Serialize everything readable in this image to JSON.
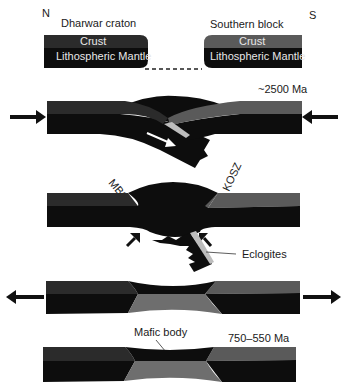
{
  "diagram": {
    "compass": {
      "north": "N",
      "south": "S"
    },
    "colors": {
      "crust_dark": "#2b2b2b",
      "crust_grey": "#5a5a5a",
      "mantle": "#0d0d0d",
      "mafic": "#6e6e6e",
      "eclogite": "#bdbdbd",
      "background": "#ffffff"
    },
    "stage1": {
      "left_block": {
        "name": "Dharwar craton",
        "crust": "Crust",
        "mantle": "Lithospheric Mantle"
      },
      "right_block": {
        "name": "Southern block",
        "crust": "Crust",
        "mantle": "Lithospheric Mantle"
      }
    },
    "stage2": {
      "age": "~2500 Ma",
      "arrows": "convergence (inward)"
    },
    "stage3": {
      "shear_zones": [
        "MBSZ",
        "KOSZ"
      ],
      "label": "Eclogites"
    },
    "stage4": {
      "arrows": "extension (outward)"
    },
    "stage5": {
      "age": "750–550 Ma",
      "label": "Mafic body"
    }
  }
}
